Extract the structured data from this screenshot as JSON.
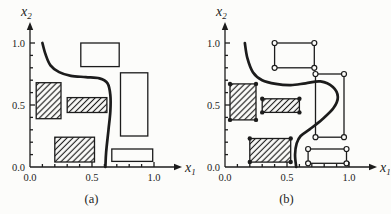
{
  "figure": {
    "background": "#fcfcfa",
    "ink": "#1c1c1c"
  },
  "chart_data": [
    {
      "id": "a",
      "type": "line",
      "caption": "(a)",
      "xlabel": {
        "base": "x",
        "sub": "1"
      },
      "ylabel": {
        "base": "x",
        "sub": "2"
      },
      "xlim": [
        0,
        1.0
      ],
      "ylim": [
        0,
        1.0
      ],
      "grid": false,
      "legend": false,
      "minor_tick_step": 0.1,
      "xticks": [
        {
          "value": 0.0,
          "label": "0.0"
        },
        {
          "value": 0.5,
          "label": "0.5"
        },
        {
          "value": 1.0,
          "label": "1.0"
        }
      ],
      "yticks": [
        {
          "value": 0.0,
          "label": "0.0"
        },
        {
          "value": 0.5,
          "label": "0.5"
        },
        {
          "value": 1.0,
          "label": "1.0"
        }
      ],
      "boundary_curve": [
        [
          0.1,
          1.0
        ],
        [
          0.125,
          0.91
        ],
        [
          0.165,
          0.82
        ],
        [
          0.235,
          0.765
        ],
        [
          0.33,
          0.735
        ],
        [
          0.45,
          0.725
        ],
        [
          0.56,
          0.715
        ],
        [
          0.625,
          0.675
        ],
        [
          0.648,
          0.58
        ],
        [
          0.648,
          0.45
        ],
        [
          0.633,
          0.3
        ],
        [
          0.614,
          0.12
        ],
        [
          0.608,
          0.0
        ]
      ],
      "regions": [
        {
          "style": "hatched",
          "corner_marker": "none",
          "x": 0.05,
          "y": 0.39,
          "w": 0.2,
          "h": 0.29
        },
        {
          "style": "hatched",
          "corner_marker": "none",
          "x": 0.3,
          "y": 0.44,
          "w": 0.32,
          "h": 0.12
        },
        {
          "style": "hatched",
          "corner_marker": "none",
          "x": 0.2,
          "y": 0.04,
          "w": 0.32,
          "h": 0.2
        },
        {
          "style": "open",
          "corner_marker": "none",
          "x": 0.41,
          "y": 0.81,
          "w": 0.31,
          "h": 0.19
        },
        {
          "style": "open",
          "corner_marker": "none",
          "x": 0.73,
          "y": 0.25,
          "w": 0.22,
          "h": 0.51
        },
        {
          "style": "open",
          "corner_marker": "none",
          "x": 0.66,
          "y": 0.045,
          "w": 0.33,
          "h": 0.1
        }
      ]
    },
    {
      "id": "b",
      "type": "line",
      "caption": "(b)",
      "xlabel": {
        "base": "x",
        "sub": "1"
      },
      "ylabel": {
        "base": "x",
        "sub": "2"
      },
      "xlim": [
        0,
        1.0
      ],
      "ylim": [
        0,
        1.0
      ],
      "grid": false,
      "legend": false,
      "minor_tick_step": 0.1,
      "xticks": [
        {
          "value": 0.0,
          "label": "0.0"
        },
        {
          "value": 0.5,
          "label": "0.5"
        },
        {
          "value": 1.0,
          "label": "1.0"
        }
      ],
      "yticks": [
        {
          "value": 0.0,
          "label": "0.0"
        },
        {
          "value": 0.5,
          "label": "0.5"
        },
        {
          "value": 1.0,
          "label": "1.0"
        }
      ],
      "boundary_curve": [
        [
          0.16,
          1.0
        ],
        [
          0.18,
          0.88
        ],
        [
          0.225,
          0.765
        ],
        [
          0.3,
          0.7
        ],
        [
          0.41,
          0.67
        ],
        [
          0.53,
          0.66
        ],
        [
          0.65,
          0.675
        ],
        [
          0.77,
          0.69
        ],
        [
          0.87,
          0.645
        ],
        [
          0.91,
          0.565
        ],
        [
          0.875,
          0.475
        ],
        [
          0.785,
          0.385
        ],
        [
          0.685,
          0.305
        ],
        [
          0.61,
          0.25
        ],
        [
          0.578,
          0.19
        ],
        [
          0.565,
          0.1
        ],
        [
          0.574,
          0.0
        ]
      ],
      "regions": [
        {
          "style": "hatched",
          "corner_marker": "filled-dot",
          "x": 0.04,
          "y": 0.38,
          "w": 0.21,
          "h": 0.29
        },
        {
          "style": "hatched",
          "corner_marker": "filled-dot",
          "x": 0.3,
          "y": 0.44,
          "w": 0.3,
          "h": 0.11
        },
        {
          "style": "hatched",
          "corner_marker": "filled-dot",
          "x": 0.2,
          "y": 0.04,
          "w": 0.33,
          "h": 0.19
        },
        {
          "style": "open",
          "corner_marker": "open-circle",
          "x": 0.4,
          "y": 0.8,
          "w": 0.32,
          "h": 0.2
        },
        {
          "style": "open",
          "corner_marker": "open-circle",
          "x": 0.73,
          "y": 0.24,
          "w": 0.23,
          "h": 0.51
        },
        {
          "style": "open",
          "corner_marker": "open-circle",
          "x": 0.67,
          "y": 0.03,
          "w": 0.31,
          "h": 0.115
        }
      ]
    }
  ]
}
